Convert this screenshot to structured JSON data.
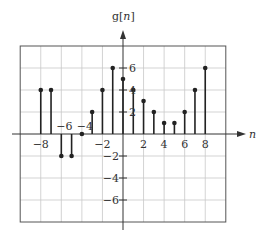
{
  "chart_data": {
    "type": "stem",
    "title": "",
    "xlabel": "n",
    "ylabel": "g[n]",
    "x": [
      -8,
      -7,
      -6,
      -5,
      -4,
      -3,
      -2,
      -1,
      0,
      1,
      2,
      3,
      4,
      5,
      6,
      7,
      8
    ],
    "values": [
      4,
      4,
      -2,
      -2,
      0,
      2,
      4,
      6,
      5,
      4,
      3,
      2,
      1,
      1,
      2,
      4,
      6
    ],
    "xlim": [
      -10,
      10
    ],
    "ylim": [
      -8,
      8
    ],
    "xticks": [
      -8,
      -6,
      -4,
      -2,
      2,
      4,
      6,
      8
    ],
    "yticks": [
      -6,
      -4,
      -2,
      2,
      4,
      6
    ],
    "xtick_labels": [
      "−8",
      "−6",
      "−4",
      "−2",
      "2",
      "4",
      "6",
      "8"
    ],
    "ytick_labels": [
      "−6",
      "−4",
      "−2",
      "2",
      "4",
      "6"
    ],
    "grid": true,
    "colors": {
      "grid": "#c8c8c8",
      "frame": "#555555",
      "stem": "#222222",
      "axis": "#333333"
    }
  },
  "labels": {
    "y_axis": "g[n]",
    "x_axis": "n"
  }
}
